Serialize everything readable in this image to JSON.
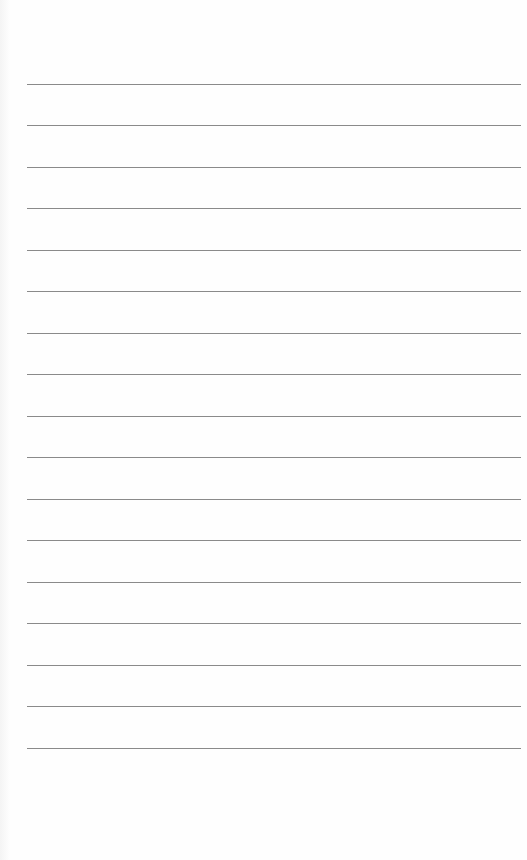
{
  "page": {
    "type": "lined-paper",
    "background_color": "#fefefe",
    "rule_color": "#8a8a8a",
    "rule_left": 27,
    "rule_width": 494,
    "rules": [
      {
        "y": 84
      },
      {
        "y": 125
      },
      {
        "y": 167
      },
      {
        "y": 208
      },
      {
        "y": 250
      },
      {
        "y": 291
      },
      {
        "y": 333
      },
      {
        "y": 374
      },
      {
        "y": 416
      },
      {
        "y": 457
      },
      {
        "y": 499
      },
      {
        "y": 540
      },
      {
        "y": 582
      },
      {
        "y": 623
      },
      {
        "y": 665
      },
      {
        "y": 706
      },
      {
        "y": 748
      }
    ]
  }
}
